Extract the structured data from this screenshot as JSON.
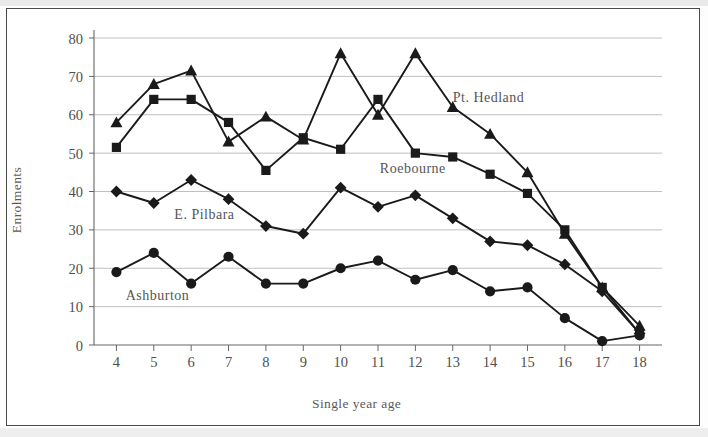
{
  "chart_data": {
    "type": "line",
    "title": "",
    "xlabel": "Single year age",
    "ylabel": "Enrolments",
    "x": [
      4,
      5,
      6,
      7,
      8,
      9,
      10,
      11,
      12,
      13,
      14,
      15,
      16,
      17,
      18
    ],
    "xlim": [
      3.4,
      18.6
    ],
    "ylim": [
      0,
      80
    ],
    "yticks": [
      0,
      10,
      20,
      30,
      40,
      50,
      60,
      70,
      80
    ],
    "xticks": [
      4,
      5,
      6,
      7,
      8,
      9,
      10,
      11,
      12,
      13,
      14,
      15,
      16,
      17,
      18
    ],
    "grid": "horizontal",
    "legend": "inline-annotations",
    "series": [
      {
        "name": "Pt. Hedland",
        "marker": "triangle",
        "color": "#1a1a1a",
        "values": [
          58,
          68,
          71.5,
          53,
          59.5,
          53.5,
          76,
          60,
          76,
          62,
          55,
          45,
          29,
          15,
          5
        ]
      },
      {
        "name": "Roebourne",
        "marker": "square",
        "color": "#1a1a1a",
        "values": [
          51.5,
          64,
          64,
          58,
          45.5,
          54,
          51,
          64,
          50,
          49,
          44.5,
          39.5,
          30,
          15,
          3
        ]
      },
      {
        "name": "E. Pilbara",
        "marker": "diamond",
        "color": "#1a1a1a",
        "values": [
          40,
          37,
          43,
          38,
          31,
          29,
          41,
          36,
          39,
          33,
          27,
          26,
          21,
          14,
          3
        ]
      },
      {
        "name": "Ashburton",
        "marker": "circle",
        "color": "#1a1a1a",
        "values": [
          19,
          24,
          16,
          23,
          16,
          16,
          20,
          22,
          17,
          19.5,
          14,
          15,
          7,
          1,
          2.5
        ]
      }
    ],
    "annotations": [
      {
        "text": "Pt. Hedland",
        "x": 13.0,
        "y": 64
      },
      {
        "text": "Roebourne",
        "x": 11.05,
        "y": 45.5
      },
      {
        "text": "E. Pilbara",
        "x": 5.55,
        "y": 33.5
      },
      {
        "text": "Ashburton",
        "x": 4.25,
        "y": 12.5
      }
    ]
  }
}
